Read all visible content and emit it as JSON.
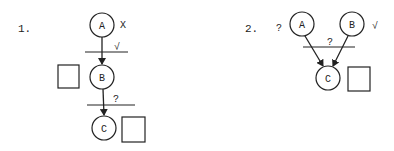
{
  "diagrams": [
    {
      "label": "1.",
      "nodes": {
        "A": "A",
        "B": "B",
        "C": "C"
      },
      "annotations": {
        "a_mark": "X",
        "bar1_mark": "√",
        "bar2_mark": "?"
      },
      "boxes": [
        "box-b",
        "box-c"
      ]
    },
    {
      "label": "2.",
      "nodes": {
        "A": "A",
        "B": "B",
        "C": "C"
      },
      "annotations": {
        "a_mark": "?",
        "b_mark": "√",
        "bar_mark": "?"
      },
      "boxes": [
        "box-c"
      ]
    }
  ]
}
